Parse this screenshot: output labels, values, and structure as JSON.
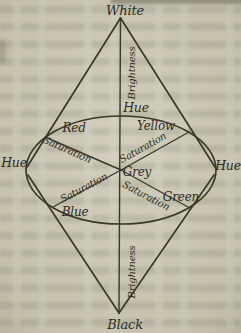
{
  "page": {
    "paper_color": "#cdc9b5",
    "ink_color": "#3a372d"
  },
  "diagram": {
    "vertices": {
      "top": "White",
      "bottom": "Black"
    },
    "axis": {
      "upper_label": "Brightness",
      "lower_label": "Brightness"
    },
    "hue": {
      "top": "Hue",
      "left": "Hue",
      "right": "Hue"
    },
    "center": "Grey",
    "colors": {
      "red": "Red",
      "yellow": "Yellow",
      "green": "Green",
      "blue": "Blue"
    },
    "saturation": {
      "red_axis": "Saturation",
      "yellow_axis": "Saturation",
      "blue_axis": "Saturation",
      "green_axis": "Saturation"
    }
  }
}
